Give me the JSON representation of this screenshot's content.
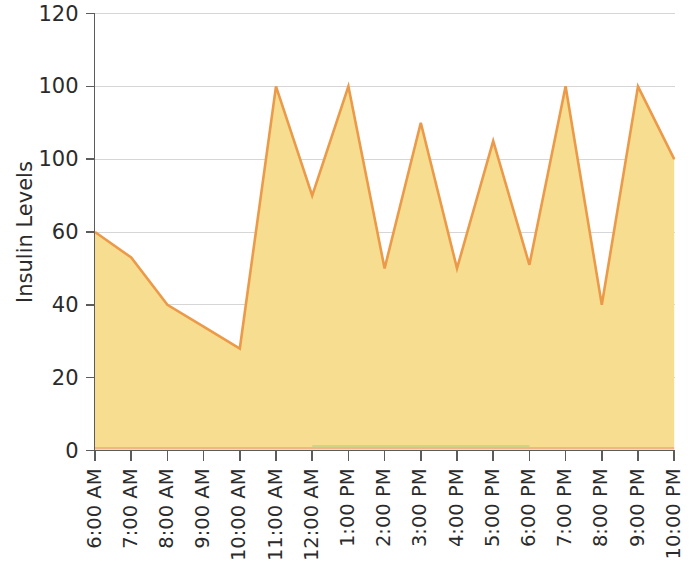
{
  "chart_data": {
    "type": "area",
    "title": "",
    "xlabel": "",
    "ylabel": "Insulin Levels",
    "categories": [
      "6:00 AM",
      "7:00 AM",
      "8:00 AM",
      "9:00 AM",
      "10:00 AM",
      "11:00 AM",
      "12:00 AM",
      "1:00 PM",
      "2:00 PM",
      "3:00 PM",
      "4:00 PM",
      "5:00 PM",
      "6:00 PM",
      "7:00 PM",
      "8:00 PM",
      "9:00 PM",
      "10:00 PM"
    ],
    "values": [
      60,
      53,
      40,
      34,
      28,
      100,
      70,
      100,
      50,
      90,
      50,
      85,
      51,
      100,
      40,
      100,
      80
    ],
    "series": [
      {
        "name": "Insulin Levels",
        "values": [
          60,
          53,
          40,
          34,
          28,
          100,
          70,
          100,
          50,
          90,
          50,
          85,
          51,
          100,
          40,
          100,
          80
        ]
      }
    ],
    "ylim": [
      0,
      120
    ],
    "ytick_labels": [
      "120",
      "100",
      "100",
      "60",
      "40",
      "20",
      "0"
    ],
    "ytick_values": [
      120,
      100,
      80,
      60,
      40,
      20,
      0
    ],
    "grid": true,
    "grid_axis": "y",
    "legend": false,
    "legend_position": "none",
    "colors": {
      "area_fill": "#f7dd8f",
      "line_stroke": "#eb9a4a",
      "axis": "#5c5c5c",
      "grid": "#d6d6d6",
      "text": "#2b2b2b",
      "background": "#ffffff",
      "artifact_red": "#e8607a",
      "artifact_green": "#7ac47a"
    }
  },
  "axis_titles": {
    "y": "Insulin Levels"
  }
}
